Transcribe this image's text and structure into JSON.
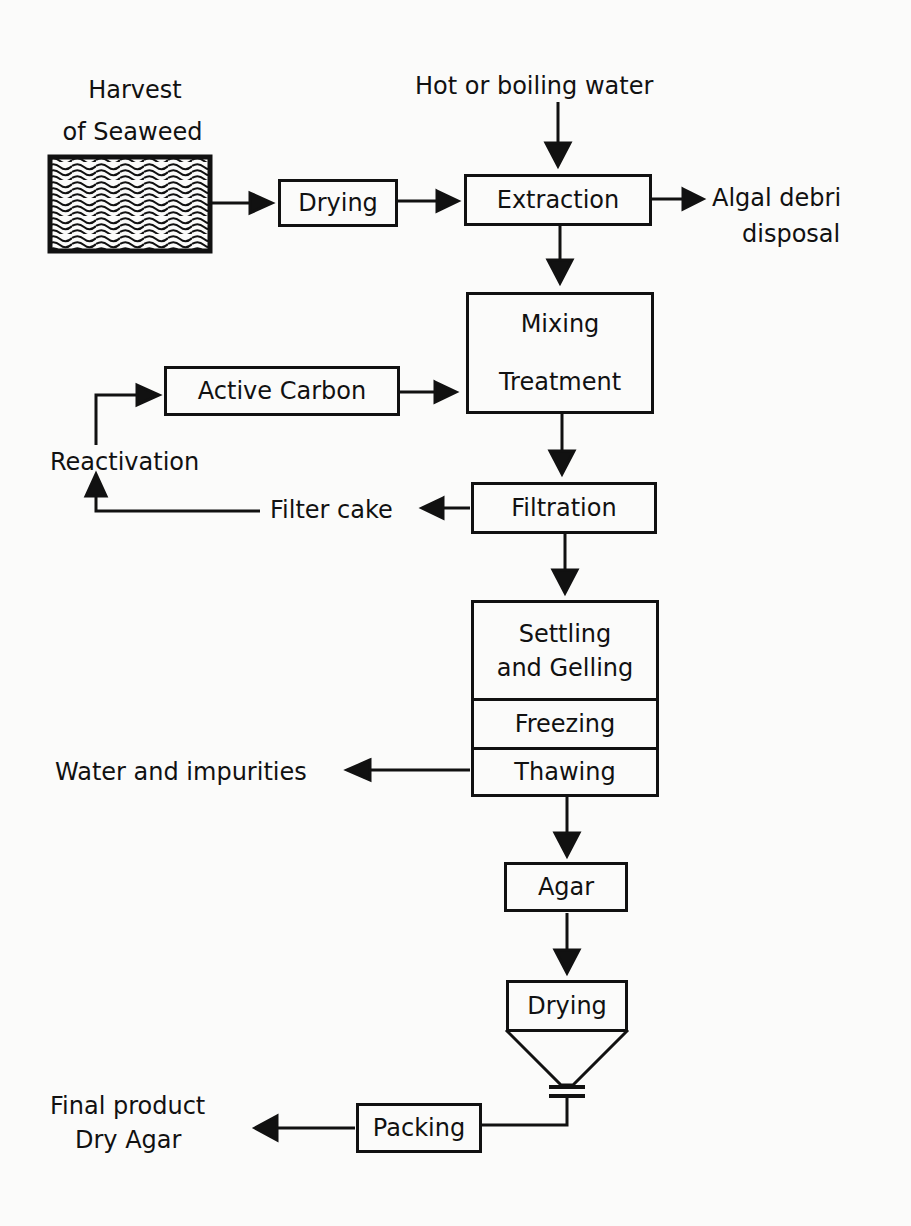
{
  "diagram": {
    "inputs": {
      "harvest": [
        "Harvest",
        "of Seaweed"
      ],
      "hot_water": "Hot or boiling water"
    },
    "steps": {
      "drying1": "Drying",
      "extraction": "Extraction",
      "mixing": "Mixing",
      "treatment": "Treatment",
      "active_carbon": "Active Carbon",
      "filtration": "Filtration",
      "settling": [
        "Settling",
        "and Gelling"
      ],
      "freezing": "Freezing",
      "thawing": "Thawing",
      "agar": "Agar",
      "drying2": "Drying",
      "packing": "Packing"
    },
    "outputs": {
      "algal": [
        "Algal debri",
        "disposal"
      ],
      "reactivation": "Reactivation",
      "filter_cake": "Filter cake",
      "water": "Water and impurities",
      "final": [
        "Final product",
        "Dry Agar"
      ]
    },
    "colors": {
      "ink": "#111111",
      "background": "#fbfbfa"
    }
  }
}
